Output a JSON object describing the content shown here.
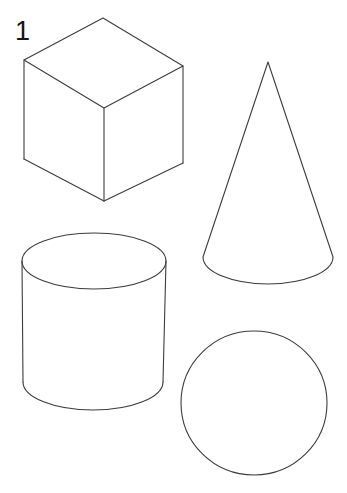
{
  "page": {
    "background_color": "#ffffff",
    "stroke_color": "#3c3c3c",
    "width": 347,
    "height": 493
  },
  "item": {
    "number": "1"
  },
  "figures": [
    {
      "id": "cube",
      "name": "cube",
      "label": "Cube",
      "projection": "isometric",
      "vertices": {
        "top_apex": [
          103,
          18
        ],
        "left_top": [
          24,
          60
        ],
        "right_top": [
          183,
          66
        ],
        "center": [
          104,
          108
        ],
        "left_bottom": [
          24,
          159
        ],
        "right_bottom": [
          183,
          163
        ],
        "bottom": [
          104,
          201
        ]
      }
    },
    {
      "id": "cone",
      "name": "cone",
      "label": "Cone",
      "apex": [
        268,
        62
      ],
      "base_ellipse": {
        "center_x": 268,
        "center_y": 257,
        "radius_x": 65,
        "radius_y": 27
      }
    },
    {
      "id": "cylinder",
      "name": "cylinder",
      "label": "Cylinder",
      "top_ellipse": {
        "center_x": 94,
        "center_y": 261,
        "radius_x": 72,
        "radius_y": 28
      },
      "bottom_ellipse": {
        "center_x": 93,
        "center_y": 382,
        "radius_x": 70,
        "radius_y": 28
      },
      "height": 121
    },
    {
      "id": "circle",
      "name": "circle",
      "label": "Circle",
      "center": [
        254,
        403
      ],
      "radius_x": 73,
      "radius_y": 72
    }
  ]
}
